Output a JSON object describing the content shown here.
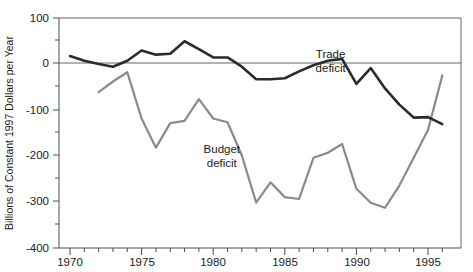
{
  "chart_data": {
    "type": "line",
    "title": "",
    "xlabel": "",
    "ylabel": "Billions of Constant 1997 Dollars per Year",
    "xlim": [
      1969,
      1996.6
    ],
    "ylim": [
      -400,
      100
    ],
    "grid": false,
    "legend_position": "inline-annotations",
    "y_ticks": [
      100,
      0,
      -100,
      -200,
      -300,
      -400
    ],
    "y_tick_labels": [
      "100",
      "0",
      "-100",
      "-200",
      "-300",
      "-400"
    ],
    "y_minor_ticks": [
      50,
      -50,
      -150,
      -250,
      -350
    ],
    "x_ticks": [
      1970,
      1975,
      1980,
      1985,
      1990,
      1995
    ],
    "x_tick_labels": [
      "1970",
      "1975",
      "1980",
      "1985",
      "1990",
      "1995"
    ],
    "x_minor_tick_step": 1,
    "x": [
      1970,
      1971,
      1972,
      1973,
      1974,
      1975,
      1976,
      1977,
      1978,
      1979,
      1980,
      1981,
      1982,
      1983,
      1984,
      1985,
      1986,
      1987,
      1988,
      1989,
      1990,
      1991,
      1992,
      1993,
      1994,
      1995,
      1996
    ],
    "series": [
      {
        "name": "Trade deficit",
        "color": "#2b2b2b",
        "label_x": 1988.2,
        "label_y": 10,
        "values": [
          15,
          5,
          -2,
          -8,
          5,
          27,
          18,
          20,
          47,
          30,
          12,
          12,
          -8,
          -35,
          -35,
          -33,
          -18,
          -5,
          5,
          9,
          -45,
          -11,
          -55,
          -90,
          -118,
          -117,
          -132
        ]
      },
      {
        "name": "Budget deficit",
        "color": "#8a8a8a",
        "label_x": 1980.6,
        "label_y": -194,
        "values": [
          null,
          null,
          -63,
          -40,
          -20,
          -120,
          -183,
          -130,
          -125,
          -78,
          -120,
          -128,
          -200,
          -302,
          -258,
          -290,
          -294,
          -205,
          -194,
          -175,
          -272,
          -302,
          -313,
          -265,
          -205,
          -145,
          -27
        ]
      }
    ],
    "annotations": [
      {
        "text": "Trade",
        "line2": "deficit",
        "series": "trade"
      },
      {
        "text": "Budget",
        "line2": "deficit",
        "series": "budget"
      }
    ]
  },
  "axis": {
    "y_title": "Billions of Constant 1997 Dollars per Year"
  },
  "labels": {
    "y": [
      "100",
      "0",
      "-100",
      "-200",
      "-300",
      "-400"
    ],
    "x": [
      "1970",
      "1975",
      "1980",
      "1985",
      "1990",
      "1995"
    ],
    "trade_line1": "Trade",
    "trade_line2": "deficit",
    "budget_line1": "Budget",
    "budget_line2": "deficit"
  }
}
